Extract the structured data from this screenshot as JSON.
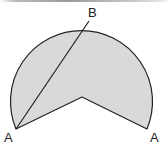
{
  "diagram": {
    "labels": {
      "left_a": "A",
      "right_a": "A",
      "top_b": "B"
    },
    "colors": {
      "fill": "#d9d9d9",
      "stroke": "#222222"
    }
  }
}
